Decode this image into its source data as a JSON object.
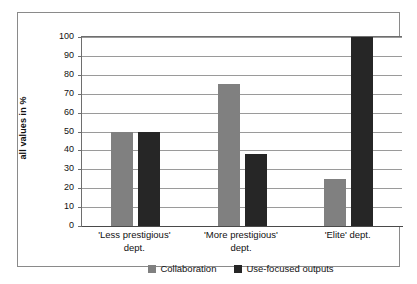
{
  "chart_data": {
    "type": "bar",
    "title": "",
    "subtitle": "",
    "xlabel": "",
    "ylabel": "all values in %",
    "ylim": [
      0,
      100
    ],
    "yticks": [
      100,
      90,
      80,
      70,
      60,
      50,
      40,
      30,
      20,
      10,
      0
    ],
    "ytick_labels": [
      "100",
      "90",
      "80",
      "70",
      "60",
      "50",
      "40",
      "30",
      "20",
      "10",
      "0"
    ],
    "grid": true,
    "grid_axis": "y",
    "legend_position": "bottom-center",
    "categories": [
      "'Less prestigious'\ndept.",
      "'More prestigious'\ndept.",
      "'Elite' dept."
    ],
    "series": [
      {
        "name": "Collaboration",
        "color": "#808080",
        "values": [
          50,
          75,
          25
        ]
      },
      {
        "name": "Use-focused outputs",
        "color": "#262626",
        "values": [
          50,
          38,
          100
        ]
      }
    ]
  },
  "figure": {
    "border_color": "#8a8a8a",
    "background": "#ffffff",
    "gridline_color": "#9a9a9a",
    "axis_color": "#4a4a4a"
  }
}
